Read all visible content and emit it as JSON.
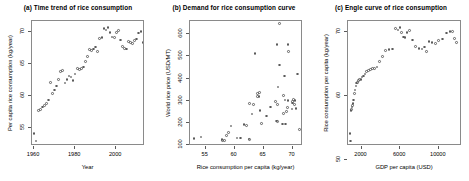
{
  "figure": {
    "background": "#ffffff",
    "point_color": "#5a5a5a",
    "axis_color": "#5a5a5a",
    "panel_count": 3
  },
  "chart_data": [
    {
      "type": "scatter",
      "panel": "a",
      "title": "(a) Time trend of rice consumption",
      "xlabel": "Year",
      "ylabel": "Per capita rice consumption (kg/year)",
      "xlim": [
        1959,
        2014
      ],
      "ylim": [
        52.2,
        71.8
      ],
      "xticks": [
        1960,
        1980,
        2000
      ],
      "yticks": [
        55,
        60,
        65,
        70
      ],
      "grid": false,
      "legend": "none",
      "x": [
        1960,
        1961,
        1962,
        1963,
        1964,
        1965,
        1966,
        1967,
        1968,
        1969,
        1970,
        1971,
        1972,
        1973,
        1974,
        1975,
        1976,
        1977,
        1978,
        1979,
        1980,
        1981,
        1982,
        1983,
        1984,
        1985,
        1986,
        1987,
        1988,
        1989,
        1990,
        1991,
        1992,
        1993,
        1994,
        1995,
        1996,
        1997,
        1998,
        1999,
        2000,
        2001,
        2002,
        2003,
        2004,
        2005,
        2006,
        2007,
        2008,
        2009,
        2010,
        2011,
        2012,
        2013
      ],
      "y": [
        54.2,
        53.0,
        57.8,
        57.9,
        58.3,
        58.6,
        58.9,
        59.4,
        62.2,
        60.4,
        61.0,
        61.6,
        62.6,
        63.9,
        64.0,
        62.1,
        62.6,
        63.2,
        63.0,
        62.5,
        63.5,
        64.3,
        64.2,
        64.4,
        64.6,
        65.5,
        66.2,
        67.3,
        67.2,
        67.4,
        67.7,
        67.0,
        69.1,
        69.2,
        70.6,
        70.4,
        70.8,
        70.0,
        69.3,
        69.2,
        70.0,
        70.3,
        68.8,
        67.8,
        67.5,
        67.4,
        68.6,
        68.4,
        68.3,
        68.7,
        69.0,
        69.9,
        70.2,
        68.4
      ]
    },
    {
      "type": "scatter",
      "panel": "b",
      "title": "(b) Demand for rice consumption curve",
      "xlabel": "Rice consumption per capita (kg/year)",
      "ylabel": "World rice price (USD/MT)",
      "xlim": [
        52.3,
        71.8
      ],
      "ylim": [
        95,
        660
      ],
      "xticks": [
        55,
        60,
        65,
        70
      ],
      "yticks": [
        100,
        200,
        300,
        400,
        500,
        600
      ],
      "grid": false,
      "legend": "none",
      "x": [
        53.0,
        54.2,
        57.8,
        57.9,
        58.3,
        58.6,
        58.9,
        59.4,
        60.4,
        61.0,
        61.6,
        62.1,
        62.5,
        62.6,
        62.6,
        63.0,
        63.2,
        63.5,
        63.9,
        64.0,
        64.2,
        64.3,
        64.4,
        64.6,
        65.5,
        66.2,
        67.0,
        67.2,
        67.3,
        67.4,
        67.4,
        67.5,
        67.7,
        67.8,
        68.3,
        68.4,
        68.4,
        68.6,
        68.7,
        68.8,
        69.0,
        69.1,
        69.2,
        69.2,
        69.3,
        69.9,
        70.0,
        70.0,
        70.2,
        70.3,
        70.4,
        70.6,
        70.8,
        71.2
      ],
      "y": [
        128,
        136,
        124,
        120,
        120,
        143,
        155,
        185,
        131,
        131,
        193,
        188,
        126,
        123,
        287,
        239,
        284,
        513,
        319,
        332,
        318,
        336,
        256,
        196,
        231,
        271,
        295,
        208,
        553,
        283,
        206,
        362,
        461,
        648,
        194,
        323,
        241,
        411,
        303,
        195,
        251,
        270,
        555,
        300,
        523,
        262,
        289,
        296,
        305,
        282,
        300,
        265,
        420,
        170
      ]
    },
    {
      "type": "scatter",
      "panel": "c",
      "title": "(c) Engle curve of rice consumption",
      "xlabel": "GDP per capita (USD)",
      "ylabel": "Rice consumption per capita (kg/year)",
      "xlim": [
        600,
        12400
      ],
      "ylim": [
        52.2,
        71.8
      ],
      "xticks": [
        2000,
        6000,
        10000
      ],
      "yticks": [
        50,
        60,
        70
      ],
      "grid": false,
      "legend": "none",
      "x": [
        820,
        860,
        900,
        950,
        1000,
        1060,
        1120,
        1190,
        1260,
        1340,
        1420,
        1510,
        1600,
        1700,
        1810,
        1930,
        2060,
        2200,
        2350,
        2520,
        2700,
        2900,
        3120,
        3350,
        3600,
        3880,
        4180,
        4500,
        4850,
        5200,
        5520,
        5780,
        5980,
        6150,
        6320,
        6500,
        6700,
        6950,
        7250,
        7600,
        7950,
        8250,
        8500,
        8750,
        9000,
        9300,
        9650,
        10000,
        10400,
        10800,
        11150,
        11400,
        11600,
        11800
      ],
      "y": [
        54.2,
        53.0,
        57.8,
        57.9,
        58.3,
        58.6,
        58.9,
        59.4,
        60.4,
        61.0,
        61.6,
        62.1,
        62.2,
        62.5,
        62.6,
        62.6,
        63.0,
        63.2,
        63.5,
        63.9,
        64.0,
        64.2,
        64.3,
        64.4,
        64.6,
        65.5,
        66.2,
        67.2,
        67.3,
        67.4,
        70.6,
        70.4,
        70.8,
        70.0,
        69.3,
        69.2,
        70.0,
        70.3,
        68.8,
        67.8,
        67.5,
        67.4,
        67.7,
        67.0,
        68.6,
        68.4,
        68.3,
        68.7,
        69.0,
        69.9,
        70.2,
        70.1,
        69.1,
        68.4
      ]
    }
  ]
}
